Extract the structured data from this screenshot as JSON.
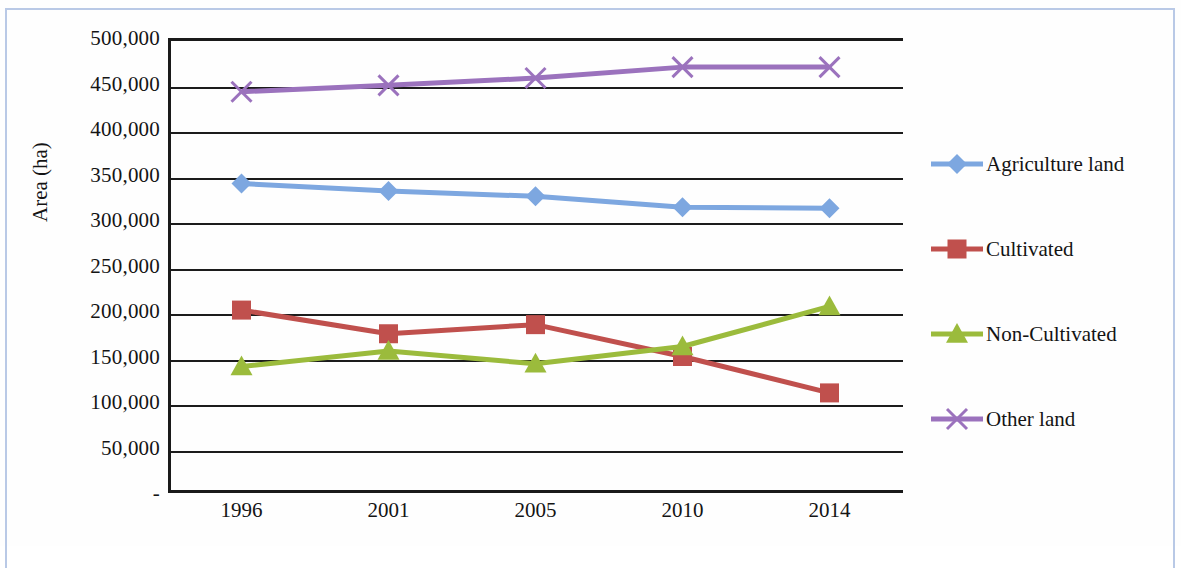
{
  "figure": {
    "border_color": "#b9c9e6",
    "background": "#fefefe"
  },
  "axis": {
    "y_title": "Area (ha)",
    "y_ticks": [
      "500,000",
      "450,000",
      "400,000",
      "350,000",
      "300,000",
      "250,000",
      "200,000",
      "150,000",
      "100,000",
      "50,000",
      "-"
    ],
    "y_tick_values": [
      500000,
      450000,
      400000,
      350000,
      300000,
      250000,
      200000,
      150000,
      100000,
      50000,
      0
    ],
    "x_ticks": [
      "1996",
      "2001",
      "2005",
      "2010",
      "2014"
    ]
  },
  "legend": {
    "position": "right",
    "items": [
      {
        "label": "Agriculture land",
        "color": "#7da7e0",
        "marker": "diamond"
      },
      {
        "label": "Cultivated",
        "color": "#c0504d",
        "marker": "square"
      },
      {
        "label": "Non-Cultivated",
        "color": "#9bbb3c",
        "marker": "triangle"
      },
      {
        "label": "Other land",
        "color": "#9b72bd",
        "marker": "x"
      }
    ]
  },
  "chart_data": {
    "type": "line",
    "title": "",
    "subtitle": "",
    "xlabel": "",
    "ylabel": "Area (ha)",
    "categories": [
      "1996",
      "2001",
      "2005",
      "2010",
      "2014"
    ],
    "ylim": [
      0,
      500000
    ],
    "y_tick_step": 50000,
    "grid": true,
    "legend_position": "right",
    "series": [
      {
        "name": "Agriculture land",
        "color": "#7da7e0",
        "marker": "diamond",
        "values": [
          340000,
          332000,
          326000,
          314000,
          313000
        ]
      },
      {
        "name": "Cultivated",
        "color": "#c0504d",
        "marker": "square",
        "values": [
          201000,
          175000,
          185000,
          150000,
          110000
        ]
      },
      {
        "name": "Non-Cultivated",
        "color": "#9bbb3c",
        "marker": "triangle",
        "values": [
          139000,
          156000,
          142000,
          161000,
          205000
        ]
      },
      {
        "name": "Other land",
        "color": "#9b72bd",
        "marker": "x",
        "values": [
          441000,
          448000,
          456000,
          468000,
          468000
        ]
      }
    ]
  }
}
